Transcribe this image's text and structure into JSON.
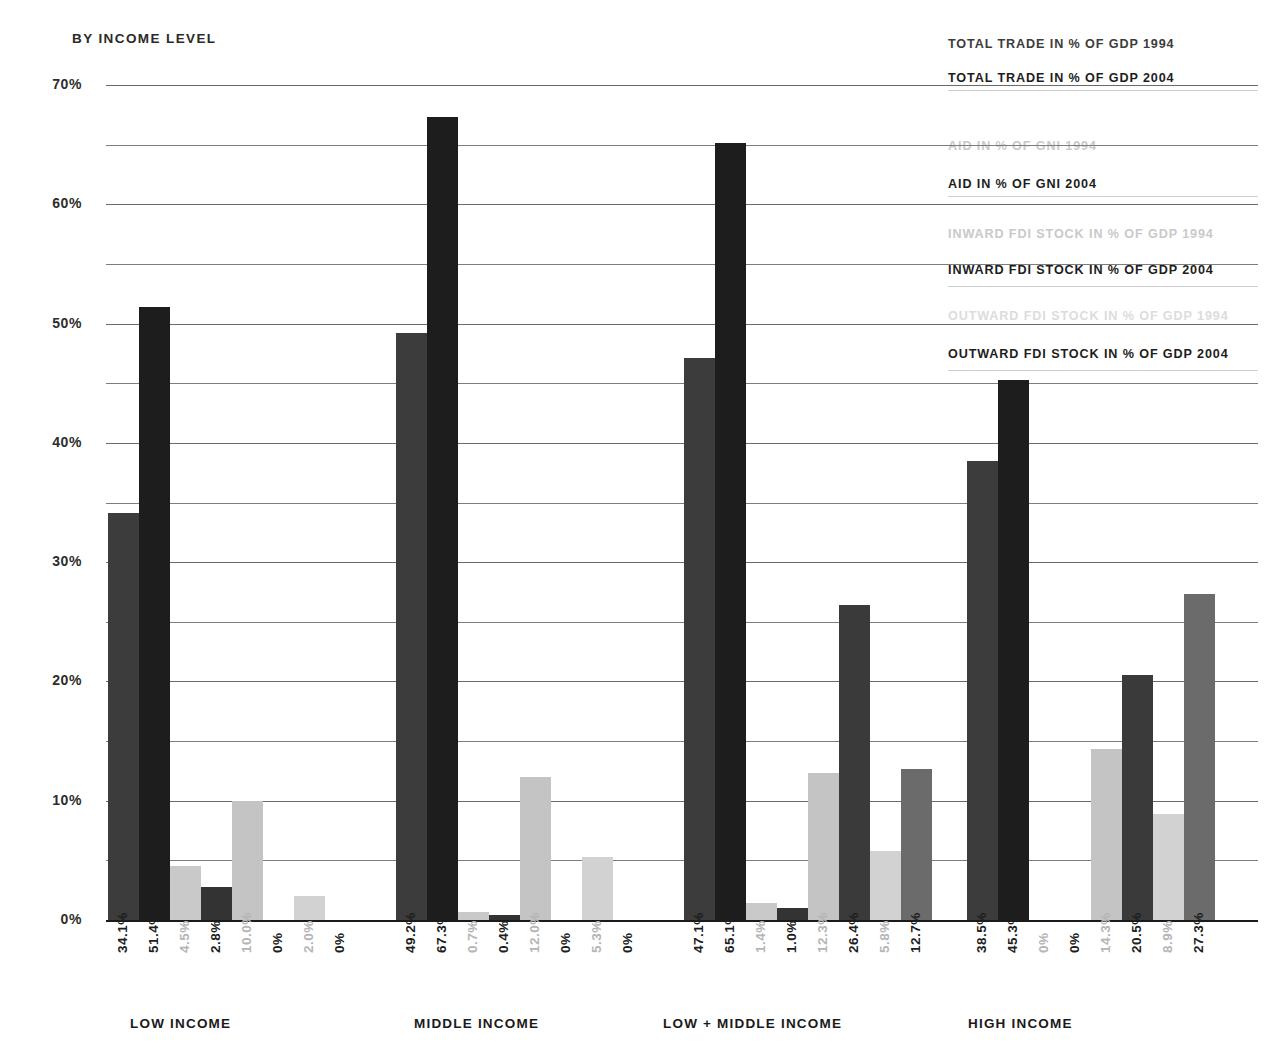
{
  "header": {
    "subtitle": "BY INCOME LEVEL"
  },
  "legend": {
    "items": [
      {
        "label": "TOTAL TRADE IN % OF GDP 1994",
        "color": "#3c3c3c"
      },
      {
        "label": "TOTAL TRADE IN % OF GDP 2004",
        "color": "#1d1d1d"
      },
      {
        "label": "AID IN % OF GNI 1994",
        "color": "#c9c9c9"
      },
      {
        "label": "AID IN % OF GNI 2004",
        "color": "#1d1d1d"
      },
      {
        "label": "INWARD FDI STOCK IN % OF GDP 1994",
        "color": "#c9c9c9"
      },
      {
        "label": "INWARD FDI STOCK IN % OF GDP 2004",
        "color": "#1d1d1d"
      },
      {
        "label": "OUTWARD FDI STOCK IN % OF GDP 1994",
        "color": "#dcdcdc"
      },
      {
        "label": "OUTWARD FDI STOCK IN % OF GDP 2004",
        "color": "#1d1d1d"
      }
    ]
  },
  "chart_data": {
    "type": "bar",
    "title": "BY INCOME LEVEL",
    "xlabel": "",
    "ylabel": "",
    "ylim": [
      0,
      70
    ],
    "ytick_labels": [
      "0%",
      "10%",
      "20%",
      "30%",
      "40%",
      "50%",
      "60%",
      "70%"
    ],
    "ytick_values": [
      0,
      10,
      20,
      30,
      40,
      50,
      60,
      70
    ],
    "gridlines": [
      0,
      5,
      10,
      15,
      20,
      25,
      30,
      35,
      40,
      45,
      50,
      55,
      60,
      65,
      70
    ],
    "grid": true,
    "legend_position": "top-right",
    "categories": [
      "LOW INCOME",
      "MIDDLE INCOME",
      "LOW + MIDDLE INCOME",
      "HIGH INCOME"
    ],
    "series": [
      {
        "name": "TOTAL TRADE IN % OF GDP 1994",
        "color": "#3c3c3c",
        "label_color": "#1d1d1d",
        "values": [
          34.1,
          49.2,
          47.1,
          38.5
        ],
        "labels": [
          "34.1%",
          "49.2%",
          "47.1%",
          "38.5%"
        ]
      },
      {
        "name": "TOTAL TRADE IN % OF GDP 2004",
        "color": "#1d1d1d",
        "label_color": "#1d1d1d",
        "values": [
          51.4,
          67.3,
          65.1,
          45.3
        ],
        "labels": [
          "51.4%",
          "67.3%",
          "65.1%",
          "45.3%"
        ]
      },
      {
        "name": "AID IN % OF GNI 1994",
        "color": "#c9c9c9",
        "label_color": "#b5b5b5",
        "values": [
          4.5,
          0.7,
          1.4,
          0.0
        ],
        "labels": [
          "4.5%",
          "0.7%",
          "1.4%",
          "0%"
        ]
      },
      {
        "name": "AID IN % OF GNI 2004",
        "color": "#333333",
        "label_color": "#1d1d1d",
        "values": [
          2.8,
          0.4,
          1.0,
          0.0
        ],
        "labels": [
          "2.8%",
          "0.4%",
          "1.0%",
          "0%"
        ]
      },
      {
        "name": "INWARD FDI STOCK IN % OF GDP 1994",
        "color": "#c4c4c4",
        "label_color": "#b5b5b5",
        "values": [
          10.0,
          12.0,
          12.3,
          14.3
        ],
        "labels": [
          "10.0%",
          "12.0%",
          "12.3%",
          "14.3%"
        ]
      },
      {
        "name": "INWARD FDI STOCK IN % OF GDP 2004",
        "color": "#3a3a3a",
        "label_color": "#1d1d1d",
        "values": [
          0.0,
          0.0,
          26.4,
          20.5
        ],
        "labels": [
          "0%",
          "0%",
          "26.4%",
          "20.5%"
        ]
      },
      {
        "name": "OUTWARD FDI STOCK IN % OF GDP 1994",
        "color": "#d2d2d2",
        "label_color": "#b5b5b5",
        "values": [
          2.0,
          5.3,
          5.8,
          8.9
        ],
        "labels": [
          "2.0%",
          "5.3%",
          "5.8%",
          "8.9%"
        ]
      },
      {
        "name": "OUTWARD FDI STOCK IN % OF GDP 2004",
        "color": "#6b6b6b",
        "label_color": "#1d1d1d",
        "values": [
          0.0,
          0.0,
          12.7,
          27.3
        ],
        "labels": [
          "0%",
          "0%",
          "12.7%",
          "27.3%"
        ]
      }
    ]
  }
}
